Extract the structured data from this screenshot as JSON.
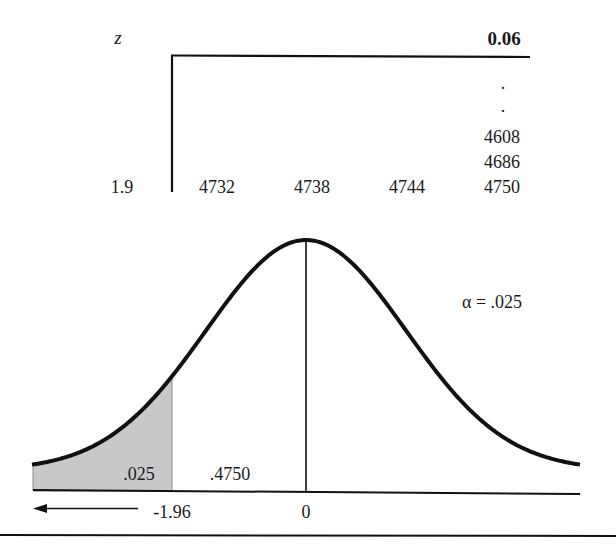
{
  "table": {
    "row_header_label": "z",
    "column_header": "0.06",
    "dots": [
      ".",
      "."
    ],
    "column_values_above": [
      "4608",
      "4686"
    ],
    "row_label": "1.9",
    "row_values": [
      "4732",
      "4738",
      "4744",
      "4750"
    ]
  },
  "curve": {
    "alpha_label": "α = .025",
    "left_tail_area": ".025",
    "center_area": ".4750",
    "critical_value": "-1.96",
    "mean_label": "0",
    "shade_color": "#c8c8c8",
    "line_color": "#111111"
  }
}
